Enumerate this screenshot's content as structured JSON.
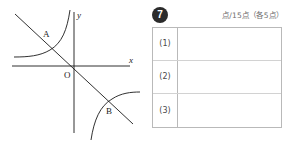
{
  "figure": {
    "axis_labels": {
      "x": "x",
      "y": "y"
    },
    "origin_label": "O",
    "point_labels": [
      "A",
      "B"
    ],
    "curves": [
      {
        "name": "hyperbola-upper-left-branch",
        "description": "inverse-proportion branch in second quadrant"
      },
      {
        "name": "hyperbola-lower-right-branch",
        "description": "inverse-proportion branch in fourth quadrant"
      },
      {
        "name": "straight-line",
        "description": "line with negative slope through origin region crossing both branches at A and B"
      }
    ]
  },
  "answer": {
    "question_number": "7",
    "score_note": "点/15点（各5点）",
    "rows": [
      {
        "label": "(1)",
        "value": ""
      },
      {
        "label": "(2)",
        "value": ""
      },
      {
        "label": "(3)",
        "value": ""
      }
    ]
  },
  "colors": {
    "ink": "#1a1a1a",
    "table_border": "#b9b9b9",
    "table_inner_line": "#d2d2d2",
    "badge_fill": "#2b2b2b",
    "note_text": "#6d6d6d"
  }
}
